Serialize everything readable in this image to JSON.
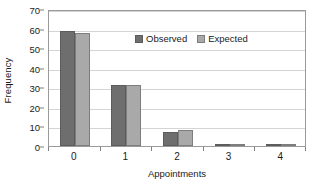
{
  "chart_data": {
    "type": "bar",
    "title": "",
    "subtitle": "",
    "xlabel": "Appointments",
    "ylabel": "Frequency",
    "categories": [
      "0",
      "1",
      "2",
      "3",
      "4"
    ],
    "series": [
      {
        "name": "Observed",
        "color": "#6e6e6e",
        "values": [
          59,
          31,
          7,
          1,
          0.6
        ]
      },
      {
        "name": "Expected",
        "color": "#a9a9a9",
        "values": [
          58,
          31,
          8,
          1,
          0.3
        ]
      }
    ],
    "ylim": [
      0,
      70
    ],
    "yticks": [
      0,
      10,
      20,
      30,
      40,
      50,
      60,
      70
    ],
    "ytick_labels": [
      "0",
      "10",
      "20",
      "30",
      "40",
      "50",
      "60",
      "70"
    ],
    "grid": true,
    "grid_axis": "y",
    "legend_position": "inside-top-center",
    "plot_background": "#ffffff",
    "grid_color": "#d4d4d4",
    "axis_color": "#9a9a9a"
  }
}
